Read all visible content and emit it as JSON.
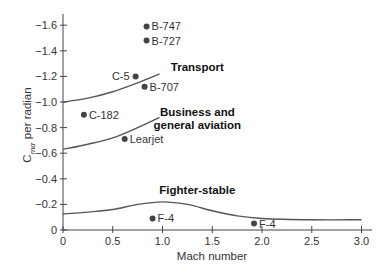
{
  "chart_data": {
    "type": "scatter",
    "title": "",
    "xlabel": "Mach number",
    "ylabel": "C_mα per radian",
    "ylabel_main": "C",
    "ylabel_sub": "mα",
    "ylabel_rest": "per radian",
    "xlim": [
      0,
      3.0
    ],
    "ylim": [
      0,
      -1.6
    ],
    "y_inverted": true,
    "grid": false,
    "x_ticks": [
      0,
      0.5,
      1.0,
      1.5,
      2.0,
      2.5,
      3.0
    ],
    "x_tick_labels": [
      "0",
      "0.5",
      "1.0",
      "1.5",
      "2.0",
      "2.5",
      "3.0"
    ],
    "y_ticks": [
      0,
      -0.2,
      -0.4,
      -0.6,
      -0.8,
      -1.0,
      -1.2,
      -1.4,
      -1.6
    ],
    "y_tick_labels": [
      "0",
      "−0.2",
      "−0.4",
      "−0.6",
      "−0.8",
      "−1.0",
      "−1.2",
      "−1.4",
      "−1.6"
    ],
    "points": [
      {
        "label": "B-747",
        "mach": 0.84,
        "cm": -1.59,
        "label_side": "right"
      },
      {
        "label": "B-727",
        "mach": 0.84,
        "cm": -1.48,
        "label_side": "right"
      },
      {
        "label": "C-5",
        "mach": 0.73,
        "cm": -1.2,
        "label_side": "left"
      },
      {
        "label": "B-707",
        "mach": 0.82,
        "cm": -1.12,
        "label_side": "right"
      },
      {
        "label": "C-182",
        "mach": 0.21,
        "cm": -0.9,
        "label_side": "right"
      },
      {
        "label": "Learjet",
        "mach": 0.62,
        "cm": -0.71,
        "label_side": "right"
      },
      {
        "label": "F-4",
        "mach": 0.9,
        "cm": -0.09,
        "label_side": "right"
      },
      {
        "label": "F-4",
        "mach": 1.92,
        "cm": -0.05,
        "label_side": "right"
      }
    ],
    "series": [
      {
        "name": "Transport",
        "type": "line",
        "x": [
          0,
          0.25,
          0.5,
          0.75,
          0.97
        ],
        "y": [
          -1.0,
          -1.03,
          -1.08,
          -1.15,
          -1.22
        ]
      },
      {
        "name": "Business and general aviation",
        "type": "line",
        "x": [
          0,
          0.25,
          0.5,
          0.75,
          0.97
        ],
        "y": [
          -0.63,
          -0.67,
          -0.72,
          -0.8,
          -0.88
        ]
      },
      {
        "name": "Fighter-stable",
        "type": "line",
        "x": [
          0,
          0.25,
          0.5,
          0.75,
          1.0,
          1.25,
          1.5,
          1.75,
          2.0,
          2.5,
          3.0
        ],
        "y": [
          -0.125,
          -0.14,
          -0.16,
          -0.2,
          -0.22,
          -0.2,
          -0.15,
          -0.11,
          -0.09,
          -0.08,
          -0.08
        ]
      }
    ],
    "annotations": [
      {
        "text": "Transport",
        "mach": 1.35,
        "cm": -1.27
      },
      {
        "text": "Business and",
        "mach": 1.35,
        "cm": -0.92
      },
      {
        "text": "general aviation",
        "mach": 1.35,
        "cm": -0.82
      },
      {
        "text": "Fighter-stable",
        "mach": 1.35,
        "cm": -0.31
      }
    ]
  }
}
